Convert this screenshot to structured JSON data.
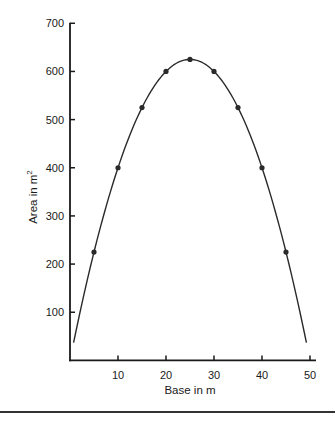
{
  "chart_data": {
    "type": "line",
    "title": "",
    "xlabel": "Base in m",
    "ylabel": "Area in m",
    "ylabel_superscript": "2",
    "xlim": [
      0,
      50
    ],
    "ylim": [
      0,
      700
    ],
    "xticks": [
      10,
      20,
      30,
      40,
      50
    ],
    "yticks": [
      100,
      200,
      300,
      400,
      500,
      600,
      700
    ],
    "grid": false,
    "legend": null,
    "series": [
      {
        "name": "Area = base × (50 − base)",
        "markers": true,
        "points": [
          {
            "x": 5,
            "y": 225
          },
          {
            "x": 10,
            "y": 400
          },
          {
            "x": 15,
            "y": 525
          },
          {
            "x": 20,
            "y": 600
          },
          {
            "x": 25,
            "y": 625
          },
          {
            "x": 30,
            "y": 600
          },
          {
            "x": 35,
            "y": 525
          },
          {
            "x": 40,
            "y": 400
          },
          {
            "x": 45,
            "y": 225
          }
        ],
        "curve_range": [
          0.75,
          49.25
        ]
      }
    ]
  },
  "style": {
    "line_color": "#2a2a2a",
    "marker_color": "#2a2a2a",
    "axis_color": "#1a1a1a"
  }
}
